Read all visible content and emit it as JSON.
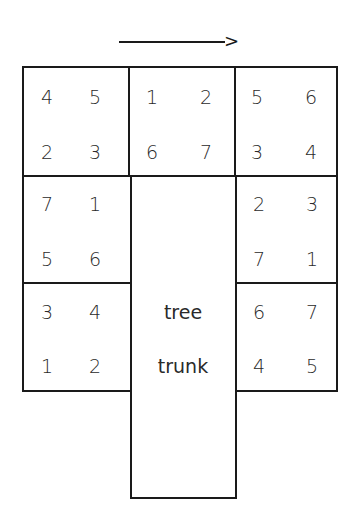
{
  "direction_arrow": {
    "label": ">"
  },
  "blocks": {
    "top_left": [
      "4",
      "5",
      "2",
      "3"
    ],
    "top_middle": [
      "1",
      "2",
      "6",
      "7"
    ],
    "top_right": [
      "5",
      "6",
      "3",
      "4"
    ],
    "mid_left": [
      "7",
      "1",
      "5",
      "6"
    ],
    "mid_right": [
      "2",
      "3",
      "7",
      "1"
    ],
    "bot_left": [
      "3",
      "4",
      "1",
      "2"
    ],
    "bot_right": [
      "6",
      "7",
      "4",
      "5"
    ]
  },
  "trunk": {
    "line1": "tree",
    "line2": "trunk"
  }
}
